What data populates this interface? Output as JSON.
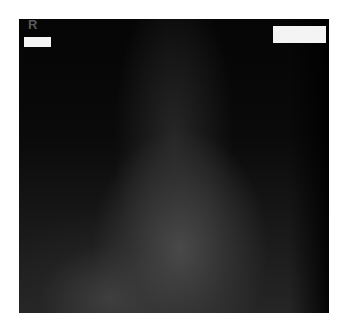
{
  "image": {
    "type": "radiograph",
    "orientation_marker": "R",
    "redaction_boxes": [
      {
        "position": "top-left"
      },
      {
        "position": "top-right"
      }
    ],
    "colors": {
      "background": "#ffffff",
      "film_dark": "#050505",
      "film_mid": "#262626",
      "marker": "#5a5a5a",
      "redaction": "#f4f4f4"
    }
  }
}
